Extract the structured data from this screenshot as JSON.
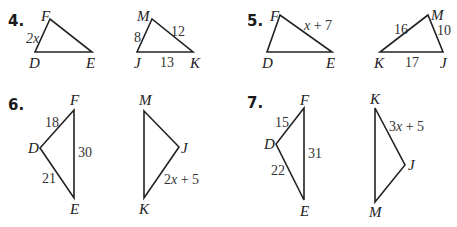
{
  "problems": [
    {
      "number": "4.",
      "triangle_a": {
        "vertices": {
          "F": "F",
          "D": "D",
          "E": "E"
        },
        "sides": {
          "DF": "2x"
        }
      },
      "triangle_b": {
        "vertices": {
          "M": "M",
          "J": "J",
          "K": "K"
        },
        "sides": {
          "JM": "8",
          "MK": "12",
          "JK": "13"
        }
      }
    },
    {
      "number": "5.",
      "triangle_a": {
        "vertices": {
          "F": "F",
          "D": "D",
          "E": "E"
        },
        "sides": {
          "FE": "x + 7"
        }
      },
      "triangle_b": {
        "vertices": {
          "M": "M",
          "K": "K",
          "J": "J"
        },
        "sides": {
          "KM": "16",
          "MJ": "10",
          "KJ": "17"
        }
      }
    },
    {
      "number": "6.",
      "triangle_a": {
        "vertices": {
          "F": "F",
          "D": "D",
          "E": "E"
        },
        "sides": {
          "DF": "18",
          "FE": "30",
          "DE": "21"
        }
      },
      "triangle_b": {
        "vertices": {
          "M": "M",
          "J": "J",
          "K": "K"
        },
        "sides": {
          "JK": "2x + 5"
        }
      }
    },
    {
      "number": "7.",
      "triangle_a": {
        "vertices": {
          "F": "F",
          "D": "D",
          "E": "E"
        },
        "sides": {
          "DF": "15",
          "FE": "31",
          "DE": "22"
        }
      },
      "triangle_b": {
        "vertices": {
          "K": "K",
          "J": "J",
          "M": "M"
        },
        "sides": {
          "KJ": "3x + 5"
        }
      }
    }
  ]
}
